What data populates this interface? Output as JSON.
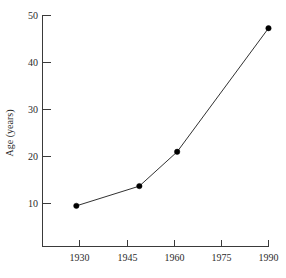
{
  "chart_data": {
    "type": "line",
    "title": "",
    "xlabel": "",
    "ylabel": "Age (years)",
    "x": [
      1929,
      1949,
      1961,
      1990
    ],
    "values": [
      9.5,
      13.7,
      21.0,
      47.3
    ],
    "series": [
      {
        "name": "Age",
        "x": [
          1929,
          1949,
          1961,
          1990
        ],
        "values": [
          9.5,
          13.7,
          21.0,
          47.3
        ]
      }
    ],
    "xlim": [
      1921,
      1990
    ],
    "ylim": [
      3.5,
      50
    ],
    "xticks": [
      1930,
      1945,
      1960,
      1975,
      1990
    ],
    "xticklabels": [
      "1930",
      "1945",
      "1960",
      "1975",
      "1990"
    ],
    "yticks": [
      10,
      20,
      30,
      40,
      50
    ],
    "yticklabels": [
      "10",
      "20",
      "30",
      "40",
      "50"
    ],
    "grid": false,
    "legend": false,
    "marker": "filled-circle",
    "line_color": "#1a1a1a",
    "marker_color": "#000000",
    "axis_color": "#3a3a3a",
    "background_color": "#ffffff"
  },
  "axes": {
    "y_title": "Age (years)",
    "x_title": "",
    "y_tick_labels": [
      "50",
      "40",
      "30",
      "20",
      "10"
    ],
    "x_tick_labels": [
      "1930",
      "1945",
      "1960",
      "1975",
      "1990"
    ]
  }
}
